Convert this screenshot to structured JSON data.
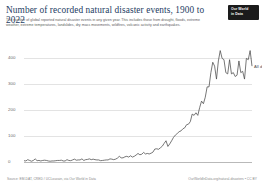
{
  "header": {
    "title": "Number of recorded natural disaster events, 1900 to 2022",
    "subtitle": "The number of global reported natural disaster events in any given year. This includes those from drought, floods, extreme weather, extreme temperatures, landslides, dry mass movements, wildfires, volcanic activity and earthquakes.",
    "logo_line1": "Our World",
    "logo_line2": "in Data"
  },
  "footer": {
    "source": "Source: EM-DAT, CRED / UCLouvain, via Our World in Data",
    "license": "OurWorldInData.org/natural-disasters • CC BY"
  },
  "chart_data": {
    "type": "line",
    "title": "Number of recorded natural disaster events, 1900 to 2022",
    "subtitle": "The number of global reported natural disaster events in any given year. This includes those from drought, floods, extreme weather, extreme temperatures, landslides, dry mass movements, wildfires, volcanic activity and earthquakes.",
    "xlabel": "",
    "ylabel": "",
    "xlim": [
      1900,
      2022
    ],
    "ylim": [
      0,
      440
    ],
    "grid": true,
    "grid_axis": "y",
    "legend": "inline-right-end-label",
    "line_color": "#4a4a4a",
    "yticks": [
      0,
      100,
      200,
      300,
      400
    ],
    "ytick_labels": [
      "0",
      "100",
      "200",
      "300",
      "400"
    ],
    "xticks": [
      1900,
      1920,
      1940,
      1960,
      1980,
      2000,
      2022
    ],
    "xtick_labels": [
      "1900",
      "1920",
      "1940",
      "1960",
      "1980",
      "2000",
      "2022"
    ],
    "series": [
      {
        "name": "All disasters",
        "end_label": "All disasters",
        "x": [
          1900,
          1901,
          1902,
          1903,
          1904,
          1905,
          1906,
          1907,
          1908,
          1909,
          1910,
          1911,
          1912,
          1913,
          1914,
          1915,
          1916,
          1917,
          1918,
          1919,
          1920,
          1921,
          1922,
          1923,
          1924,
          1925,
          1926,
          1927,
          1928,
          1929,
          1930,
          1931,
          1932,
          1933,
          1934,
          1935,
          1936,
          1937,
          1938,
          1939,
          1940,
          1941,
          1942,
          1943,
          1944,
          1945,
          1946,
          1947,
          1948,
          1949,
          1950,
          1951,
          1952,
          1953,
          1954,
          1955,
          1956,
          1957,
          1958,
          1959,
          1960,
          1961,
          1962,
          1963,
          1964,
          1965,
          1966,
          1967,
          1968,
          1969,
          1970,
          1971,
          1972,
          1973,
          1974,
          1975,
          1976,
          1977,
          1978,
          1979,
          1980,
          1981,
          1982,
          1983,
          1984,
          1985,
          1986,
          1987,
          1988,
          1989,
          1990,
          1991,
          1992,
          1993,
          1994,
          1995,
          1996,
          1997,
          1998,
          1999,
          2000,
          2001,
          2002,
          2003,
          2004,
          2005,
          2006,
          2007,
          2008,
          2009,
          2010,
          2011,
          2012,
          2013,
          2014,
          2015,
          2016,
          2017,
          2018,
          2019,
          2020,
          2021,
          2022
        ],
        "values": [
          5,
          4,
          9,
          6,
          3,
          6,
          12,
          5,
          6,
          4,
          6,
          7,
          6,
          4,
          3,
          4,
          4,
          5,
          6,
          6,
          7,
          4,
          4,
          9,
          6,
          5,
          8,
          11,
          7,
          8,
          8,
          12,
          6,
          9,
          10,
          12,
          9,
          11,
          9,
          8,
          8,
          5,
          6,
          7,
          8,
          8,
          12,
          11,
          9,
          11,
          15,
          22,
          16,
          16,
          20,
          22,
          19,
          24,
          19,
          22,
          27,
          33,
          28,
          30,
          37,
          31,
          33,
          31,
          34,
          38,
          50,
          51,
          49,
          55,
          61,
          72,
          82,
          60,
          70,
          82,
          95,
          104,
          110,
          117,
          120,
          128,
          132,
          144,
          146,
          156,
          185,
          180,
          190,
          180,
          210,
          235,
          225,
          250,
          290,
          290,
          345,
          385,
          370,
          320,
          390,
          430,
          400,
          395,
          345,
          340,
          395,
          340,
          345,
          330,
          335,
          390,
          345,
          350,
          320,
          400,
          395,
          430,
          370
        ]
      }
    ],
    "annotations": [
      {
        "text": "All disasters",
        "year": 2022,
        "value": 370
      }
    ]
  }
}
